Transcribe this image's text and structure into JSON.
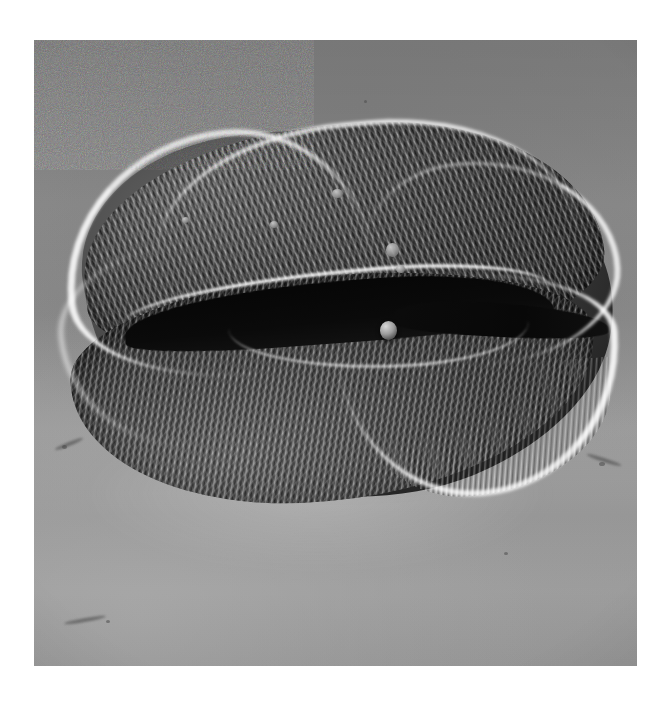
{
  "figure": {
    "kind": "scanning-electron-micrograph",
    "orientation": "equatorial view, colpus facing viewer",
    "caption": "",
    "background_tone": "#8b8b8b",
    "print_border": "#ffffff"
  },
  "plate": {
    "left": 34,
    "top": 40,
    "width": 603,
    "height": 626
  },
  "colors": {
    "page": "#ffffff",
    "field_gray": "#8b8b8b",
    "field_light": "#a4a4a4",
    "field_dark": "#7d7d7d",
    "specimen_mid": "#4a4a4a",
    "specimen_dark": "#262626",
    "furrow_black": "#060606",
    "rim_highlight": "#ffffff",
    "particle_light": "#d8d8d8"
  },
  "features": [
    {
      "name": "upper-lobe",
      "label": "upper exine lobe, striate sculpturing"
    },
    {
      "name": "lower-lobe",
      "label": "lower exine lobe, striate sculpturing"
    },
    {
      "name": "furrow",
      "label": "central colpus (deep dark aperture)"
    },
    {
      "name": "rim-highlight",
      "label": "bright charging rim along grain margin"
    },
    {
      "name": "particle",
      "label": "spherical debris particle in the furrow"
    },
    {
      "name": "fringe",
      "label": "fine ridge terminations at lower-right margin"
    },
    {
      "name": "cast-shadow",
      "label": "cast shadow on specimen stub"
    }
  ],
  "blebs": [
    {
      "left": 268,
      "top": 64,
      "w": 11,
      "h": 9
    },
    {
      "left": 206,
      "top": 96,
      "w": 8,
      "h": 7
    },
    {
      "left": 322,
      "top": 118,
      "w": 13,
      "h": 14
    },
    {
      "left": 332,
      "top": 140,
      "w": 9,
      "h": 8
    },
    {
      "left": 118,
      "top": 92,
      "w": 7,
      "h": 6
    }
  ],
  "debris": [
    {
      "left": 28,
      "top": 405,
      "w": 5,
      "h": 4
    },
    {
      "left": 565,
      "top": 422,
      "w": 6,
      "h": 4
    },
    {
      "left": 330,
      "top": 60,
      "w": 3,
      "h": 3
    },
    {
      "left": 470,
      "top": 512,
      "w": 4,
      "h": 3
    },
    {
      "left": 72,
      "top": 580,
      "w": 4,
      "h": 3
    }
  ],
  "streaks": [
    {
      "left": 20,
      "top": 402,
      "w": 30,
      "h": 4,
      "rot": -22
    },
    {
      "left": 552,
      "top": 418,
      "w": 36,
      "h": 4,
      "rot": 18
    },
    {
      "left": 30,
      "top": 578,
      "w": 42,
      "h": 4,
      "rot": -10
    }
  ]
}
